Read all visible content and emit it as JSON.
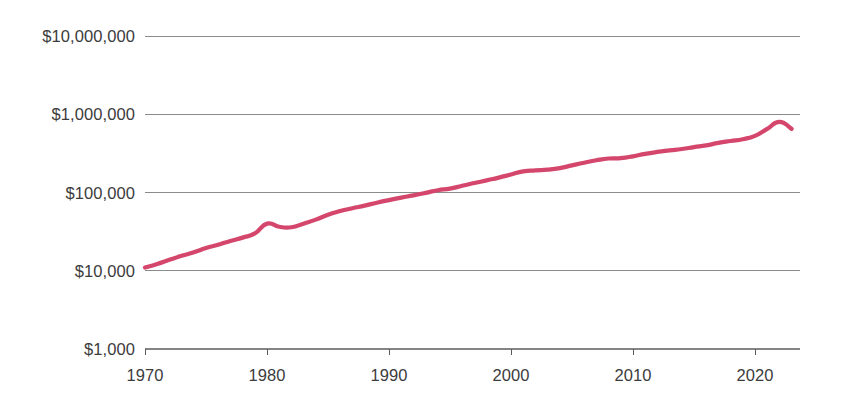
{
  "chart_data": {
    "type": "line",
    "title": "",
    "subtitle": "",
    "xlabel": "",
    "ylabel": "",
    "yscale": "log",
    "xscale": "linear",
    "grid": true,
    "legend": null,
    "legend_position": "none",
    "xlim": [
      1970,
      2023
    ],
    "ylim": [
      1000,
      10000000
    ],
    "y_tick_labels": [
      "$10,000,000",
      "$1,000,000",
      "$100,000",
      "$10,000",
      "$1,000"
    ],
    "y_tick_values": [
      10000000,
      1000000,
      100000,
      10000,
      1000
    ],
    "x_tick_labels": [
      "1970",
      "1980",
      "1990",
      "2000",
      "2010",
      "2020"
    ],
    "x_tick_values": [
      1970,
      1980,
      1990,
      2000,
      2010,
      2020
    ],
    "series": [
      {
        "name": "value",
        "color": "#d4466c",
        "x": [
          1970,
          1971,
          1972,
          1973,
          1974,
          1975,
          1976,
          1977,
          1978,
          1979,
          1980,
          1981,
          1982,
          1983,
          1984,
          1985,
          1986,
          1987,
          1988,
          1989,
          1990,
          1991,
          1992,
          1993,
          1994,
          1995,
          1996,
          1997,
          1998,
          1999,
          2000,
          2001,
          2002,
          2003,
          2004,
          2005,
          2006,
          2007,
          2008,
          2009,
          2010,
          2011,
          2012,
          2013,
          2014,
          2015,
          2016,
          2017,
          2018,
          2019,
          2020,
          2021,
          2022,
          2023
        ],
        "values": [
          11000,
          12200,
          13800,
          15500,
          17200,
          19500,
          21500,
          24000,
          26500,
          30000,
          40000,
          36500,
          36000,
          40000,
          45000,
          52000,
          58000,
          63000,
          68000,
          74000,
          80000,
          86000,
          92000,
          99000,
          107000,
          112000,
          122000,
          132000,
          143000,
          155000,
          170000,
          186000,
          192000,
          196000,
          205000,
          222000,
          240000,
          258000,
          272000,
          275000,
          290000,
          312000,
          330000,
          345000,
          360000,
          380000,
          400000,
          430000,
          455000,
          480000,
          530000,
          650000,
          800000,
          650000
        ]
      }
    ]
  },
  "axis": {
    "y_labels": [
      {
        "text": "$10,000,000",
        "value": 10000000
      },
      {
        "text": "$1,000,000",
        "value": 1000000
      },
      {
        "text": "$100,000",
        "value": 100000
      },
      {
        "text": "$10,000",
        "value": 10000
      },
      {
        "text": "$1,000",
        "value": 1000
      }
    ],
    "x_labels": [
      {
        "text": "1970",
        "value": 1970
      },
      {
        "text": "1980",
        "value": 1980
      },
      {
        "text": "1990",
        "value": 1990
      },
      {
        "text": "2000",
        "value": 2000
      },
      {
        "text": "2010",
        "value": 2010
      },
      {
        "text": "2020",
        "value": 2020
      }
    ]
  },
  "colors": {
    "line": "#d4466c",
    "grid": "#6f6f6f",
    "axis": "#5a5a5a",
    "text": "#3c3c3c",
    "background": "#ffffff"
  }
}
